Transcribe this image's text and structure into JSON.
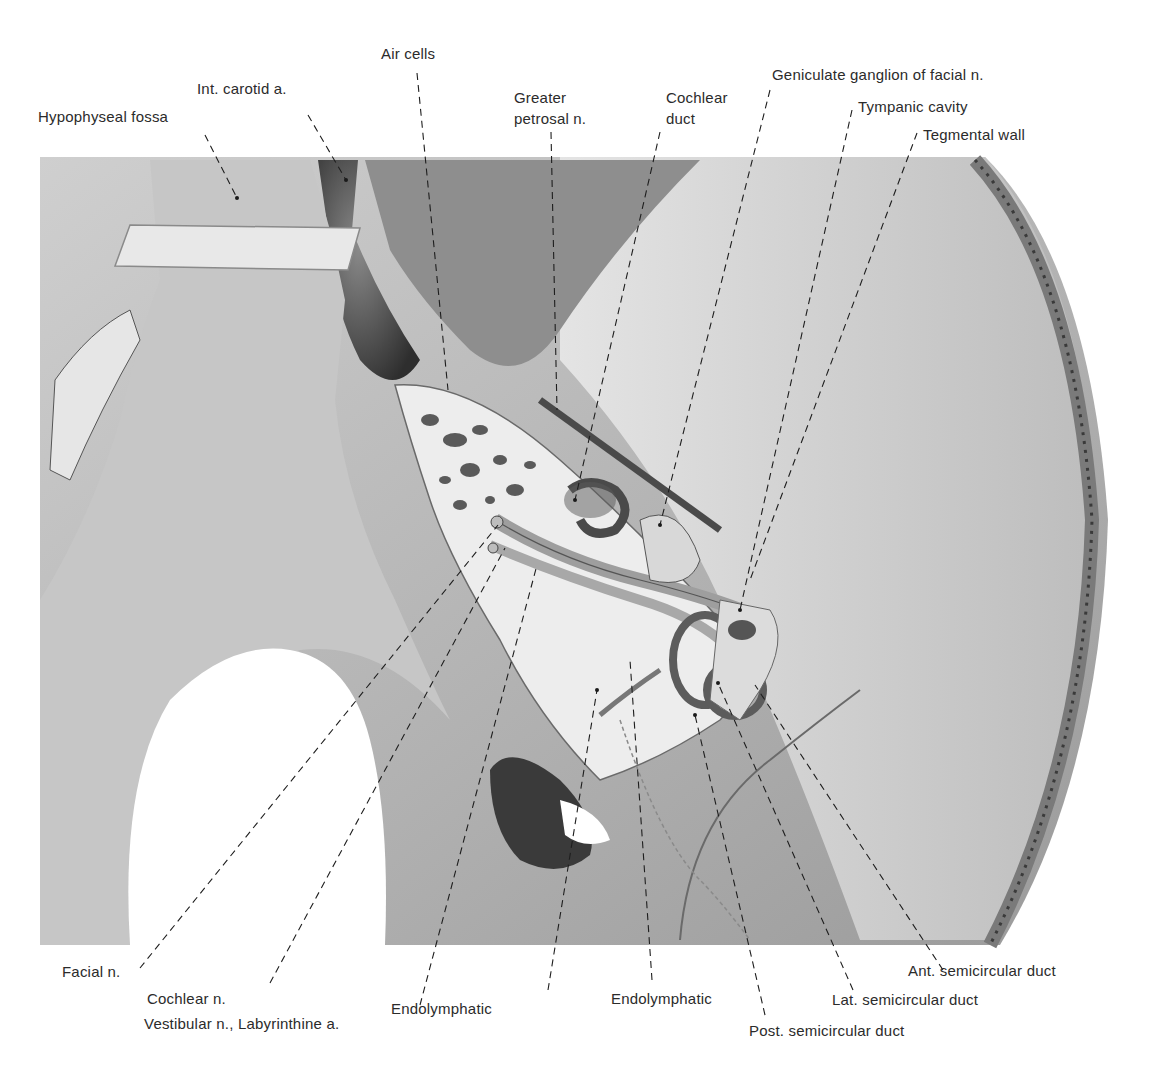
{
  "figure": {
    "type": "anatomical-illustration",
    "palette": {
      "background": "#ffffff",
      "bone_light": "#d9d9d9",
      "bone_mid": "#a8a8a8",
      "bone_dark": "#6e6e6e",
      "vessel_dark": "#3e3e3e",
      "text": "#2b2b2b"
    }
  },
  "labels": {
    "top": {
      "hypophyseal_fossa": "Hypophyseal fossa",
      "int_carotid": "Int. carotid a.",
      "air_cells": "Air cells",
      "greater_petrosal_1": "Greater",
      "greater_petrosal_2": "petrosal n.",
      "cochlear_duct_1": "Cochlear",
      "cochlear_duct_2": "duct",
      "geniculate_ganglion": "Geniculate ganglion of facial n.",
      "tympanic_cavity": "Tympanic cavity",
      "tegmental_wall": "Tegmental wall"
    },
    "bottom": {
      "facial_n": "Facial n.",
      "cochlear_n": "Cochlear n.",
      "vestibular_n": "Vestibular n., Labyrinthine a.",
      "endolymphatic_1": "Endolymphatic",
      "endolymphatic_2": "Endolymphatic",
      "post_semicircular": "Post. semicircular duct",
      "lat_semicircular": "Lat. semicircular duct",
      "ant_semicircular": "Ant. semicircular duct"
    }
  }
}
